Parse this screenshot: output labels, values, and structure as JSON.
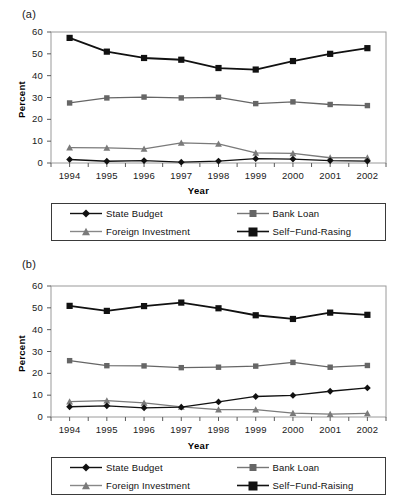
{
  "figure": {
    "panels": [
      {
        "id": "a",
        "label": "(a)",
        "chart_data": {
          "type": "line",
          "title": "(a)",
          "xlabel": "Year",
          "ylabel": "Percent",
          "categories": [
            "1994",
            "1995",
            "1996",
            "1997",
            "1998",
            "1999",
            "2000",
            "2001",
            "2002"
          ],
          "ylim": [
            0,
            60
          ],
          "yticks": [
            0,
            10,
            20,
            30,
            40,
            50,
            60
          ],
          "grid": false,
          "legend_position": "below",
          "series": [
            {
              "name": "State Budget",
              "marker": "diamond",
              "color": "#111111",
              "values": [
                1.6,
                0.8,
                1.1,
                0.4,
                0.9,
                2.0,
                1.8,
                1.1,
                0.9
              ]
            },
            {
              "name": "Bank Loan",
              "marker": "square",
              "color": "#666666",
              "values": [
                27.5,
                29.8,
                30.2,
                29.8,
                30.1,
                27.2,
                28.0,
                26.8,
                26.3
              ]
            },
            {
              "name": "Foreign Investment",
              "marker": "triangle",
              "color": "#7a7a7a",
              "values": [
                7.0,
                6.9,
                6.5,
                9.2,
                8.8,
                4.6,
                4.4,
                2.4,
                2.4
              ]
            },
            {
              "name": "Self−Fund-Rasing",
              "marker": "filled-square",
              "color": "#111111",
              "values": [
                57.3,
                51.0,
                48.1,
                47.3,
                43.5,
                42.8,
                46.7,
                50.0,
                52.6
              ]
            }
          ]
        }
      },
      {
        "id": "b",
        "label": "(b)",
        "chart_data": {
          "type": "line",
          "title": "(b)",
          "xlabel": "Year",
          "ylabel": "Percent",
          "categories": [
            "1994",
            "1995",
            "1996",
            "1997",
            "1998",
            "1999",
            "2000",
            "2001",
            "2002"
          ],
          "ylim": [
            0,
            60
          ],
          "yticks": [
            0,
            10,
            20,
            30,
            40,
            50,
            60
          ],
          "grid": false,
          "legend_position": "below",
          "series": [
            {
              "name": "State Budget",
              "marker": "diamond",
              "color": "#111111",
              "values": [
                4.7,
                5.1,
                4.2,
                4.5,
                6.9,
                9.4,
                9.9,
                11.8,
                13.3
              ]
            },
            {
              "name": "Bank Loan",
              "marker": "square",
              "color": "#666666",
              "values": [
                25.8,
                23.5,
                23.4,
                22.6,
                22.8,
                23.3,
                25.0,
                22.8,
                23.6
              ]
            },
            {
              "name": "Foreign Investment",
              "marker": "triangle",
              "color": "#7a7a7a",
              "values": [
                7.0,
                7.5,
                6.5,
                4.6,
                3.4,
                3.4,
                1.8,
                1.3,
                1.7
              ]
            },
            {
              "name": "Self−Fund-Raising",
              "marker": "filled-square",
              "color": "#111111",
              "values": [
                50.9,
                48.6,
                50.8,
                52.4,
                49.8,
                46.6,
                44.9,
                47.8,
                46.8
              ]
            }
          ]
        }
      }
    ]
  }
}
